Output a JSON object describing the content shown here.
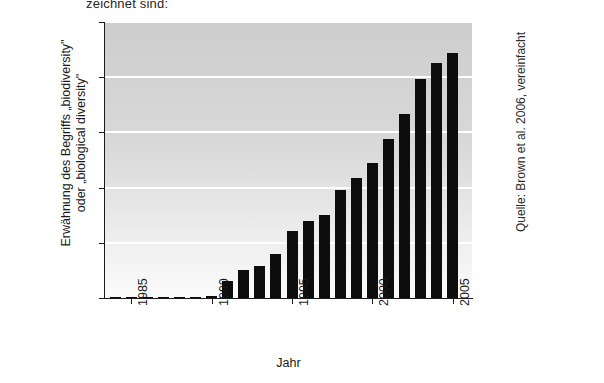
{
  "figure": {
    "top_caption": "zeichnet sind:",
    "source_note": "Quelle: Brown et al. 2006, vereinfacht"
  },
  "chart_data": {
    "type": "bar",
    "title": "",
    "xlabel": "Jahr",
    "ylabel": "Erwähnung des Begriffs „biodiversity\" oder „biological diversity\"",
    "ylabel_line1": "Erwähnung des Begriffs „biodiversity\"",
    "ylabel_line2": "oder „biological diversity\"",
    "ylim": [
      0,
      2500
    ],
    "yticks": [
      0,
      500,
      1000,
      1500,
      2000,
      2500
    ],
    "ytick_labels": [
      "0",
      "500",
      "1.000",
      "1.500",
      "2.000",
      "2.500"
    ],
    "xlim": [
      1983.3,
      2006.2
    ],
    "xticks": [
      1985,
      1990,
      1995,
      2000,
      2005
    ],
    "xtick_labels": [
      "1985",
      "1990",
      "1995",
      "2000",
      "2005"
    ],
    "grid": "horizontal-white",
    "legend": "none",
    "bar_color": "#0d0d0d",
    "plot_background": "#d6d6d6",
    "categories": [
      1984,
      1985,
      1986,
      1987,
      1988,
      1989,
      1990,
      1991,
      1992,
      1993,
      1994,
      1995,
      1996,
      1997,
      1998,
      1999,
      2000,
      2001,
      2002,
      2003,
      2004,
      2005
    ],
    "values": [
      8,
      6,
      5,
      5,
      6,
      8,
      20,
      155,
      250,
      290,
      400,
      610,
      700,
      755,
      975,
      1090,
      1220,
      1440,
      1665,
      1985,
      2130,
      2215
    ]
  }
}
